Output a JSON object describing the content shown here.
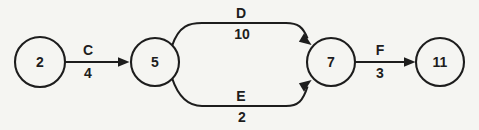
{
  "diagram": {
    "type": "directed-graph",
    "background_color": "#f5f5f2",
    "stroke_color": "#1d1d1d",
    "nodes": [
      {
        "id": "n2",
        "label": "2",
        "cx": 40,
        "cy": 62,
        "r": 25
      },
      {
        "id": "n5",
        "label": "5",
        "cx": 155,
        "cy": 62,
        "r": 24
      },
      {
        "id": "n7",
        "label": "7",
        "cx": 331,
        "cy": 62,
        "r": 24
      },
      {
        "id": "n11",
        "label": "11",
        "cx": 440,
        "cy": 62,
        "r": 24
      }
    ],
    "edges": [
      {
        "id": "edge-c",
        "name": "C",
        "weight": "4",
        "from": "n2",
        "to": "n5",
        "shape": "straight",
        "name_x": 88,
        "name_y": 50,
        "weight_x": 88,
        "weight_y": 73
      },
      {
        "id": "edge-d",
        "name": "D",
        "weight": "10",
        "from": "n5",
        "to": "n7",
        "shape": "curved-top",
        "name_x": 241,
        "name_y": 13,
        "weight_x": 242,
        "weight_y": 34
      },
      {
        "id": "edge-e",
        "name": "E",
        "weight": "2",
        "from": "n5",
        "to": "n7",
        "shape": "curved-bottom",
        "name_x": 241,
        "name_y": 96,
        "weight_x": 242,
        "weight_y": 117
      },
      {
        "id": "edge-f",
        "name": "F",
        "weight": "3",
        "from": "n7",
        "to": "n11",
        "shape": "straight",
        "name_x": 380,
        "name_y": 50,
        "weight_x": 380,
        "weight_y": 73
      }
    ]
  }
}
